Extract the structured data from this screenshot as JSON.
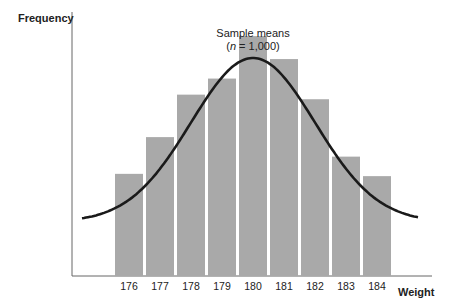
{
  "chart_data": {
    "type": "bar",
    "title": "",
    "annotation": {
      "line1": "Sample means",
      "line2_prefix": "(",
      "line2_italic": "n",
      "line2_suffix": " = 1,000)"
    },
    "xlabel": "Weight",
    "ylabel": "Frequency",
    "categories": [
      "176",
      "177",
      "178",
      "179",
      "180",
      "181",
      "182",
      "183",
      "184"
    ],
    "values": [
      89,
      121,
      158,
      172,
      209,
      189,
      154,
      104,
      87
    ],
    "ylim": [
      0,
      230
    ],
    "grid": false,
    "legend": "none",
    "overlay": "normal curve"
  },
  "colors": {
    "bar": "#a9a9a9",
    "curve": "#1a1a1a",
    "axis": "#555555"
  }
}
